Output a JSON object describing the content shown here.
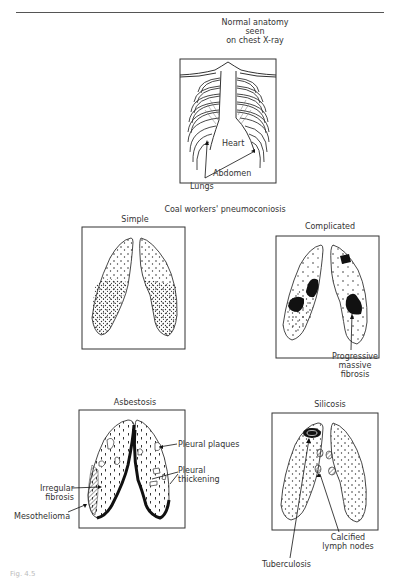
{
  "figure": {
    "caption": "Fig. 4.5",
    "normal": {
      "title_lines": [
        "Normal anatomy",
        "seen",
        "on chest X-ray"
      ],
      "labels": {
        "heart": "Heart",
        "abdomen": "Abdomen",
        "lungs": "Lungs"
      }
    },
    "cwp": {
      "title": "Coal workers' pneumoconiosis",
      "simple": {
        "title": "Simple"
      },
      "complicated": {
        "title": "Complicated",
        "labels": {
          "pmf": [
            "Progressive",
            "massive",
            "fibrosis"
          ]
        }
      }
    },
    "asbestosis": {
      "title": "Asbestosis",
      "labels": {
        "pleural_plaques": "Pleural plaques",
        "pleural_thickening": [
          "Pleural",
          "thickening"
        ],
        "irregular_fibrosis": [
          "Irregular",
          "fibrosis"
        ],
        "mesothelioma": "Mesothelioma"
      }
    },
    "silicosis": {
      "title": "Silicosis",
      "labels": {
        "calcified_lymph_nodes": [
          "Calcified",
          "lymph nodes"
        ],
        "tuberculosis": "Tuberculosis"
      }
    }
  }
}
